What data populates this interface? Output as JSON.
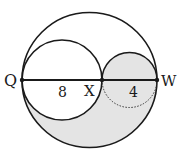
{
  "diagram": {
    "type": "geometry-circles",
    "colors": {
      "stroke": "#1a1a1a",
      "shade": "#e4e4e4",
      "background": "#ffffff"
    },
    "points": [
      {
        "label": "Q",
        "x": 22,
        "y": 80
      },
      {
        "label": "X",
        "x": 102,
        "y": 80
      },
      {
        "label": "W",
        "x": 157,
        "y": 80
      }
    ],
    "segments": [
      {
        "from": "Q",
        "to": "X",
        "length_label": "8"
      },
      {
        "from": "X",
        "to": "W",
        "length_label": "4"
      }
    ],
    "labels": {
      "Q": "Q",
      "X": "X",
      "W": "W",
      "QX_length": "8",
      "XW_length": "4"
    }
  }
}
